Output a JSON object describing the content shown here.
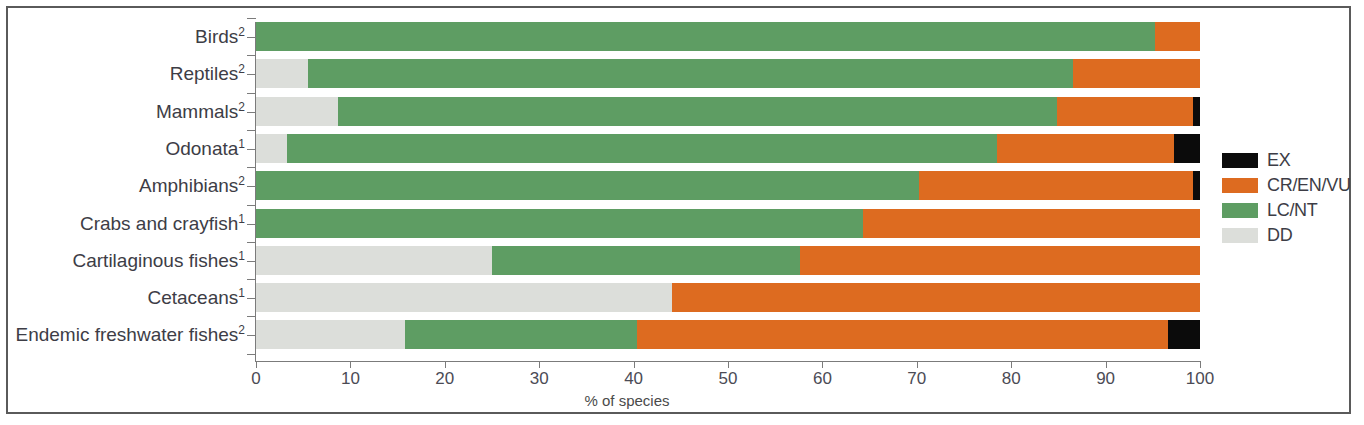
{
  "figure": {
    "axis_title": "% of species",
    "frame_color": "#5a5a5a",
    "background": "#ffffff"
  },
  "legend": {
    "position": "right",
    "items": [
      {
        "label": "EX",
        "color": "#0b0b0b",
        "key": "ex"
      },
      {
        "label": "CR/EN/VU",
        "color": "#dd6b20",
        "key": "crenvu"
      },
      {
        "label": "LC/NT",
        "color": "#5e9d63",
        "key": "lcnt"
      },
      {
        "label": "DD",
        "color": "#dcdeda",
        "key": "dd"
      }
    ]
  },
  "chart_data": {
    "type": "bar",
    "orientation": "horizontal",
    "stacked": true,
    "stack_mode": "percent",
    "title": "",
    "subtitle": "",
    "xlabel": "% of species",
    "ylabel": "",
    "xlim": [
      0,
      100
    ],
    "xticks": [
      0,
      10,
      20,
      30,
      40,
      50,
      60,
      70,
      80,
      90,
      100
    ],
    "xticklabels": [
      "0",
      "10",
      "20",
      "30",
      "40",
      "50",
      "60",
      "70",
      "80",
      "90",
      "100"
    ],
    "grid": false,
    "legend_entries": [
      "EX",
      "CR/EN/VU",
      "LC/NT",
      "DD"
    ],
    "categories": [
      "Birds",
      "Reptiles",
      "Mammals",
      "Odonata",
      "Amphibians",
      "Crabs and crayfish",
      "Cartilaginous fishes",
      "Cetaceans",
      "Endemic freshwater fishes"
    ],
    "category_footnotes": [
      "2",
      "2",
      "2",
      "1",
      "2",
      "1",
      "1",
      "1",
      "2"
    ],
    "series": [
      {
        "name": "DD",
        "color": "#dcdeda",
        "values": [
          0.0,
          5.5,
          8.7,
          3.3,
          0.0,
          0.0,
          25.0,
          44.1,
          15.8
        ]
      },
      {
        "name": "LC/NT",
        "color": "#5e9d63",
        "values": [
          95.2,
          81.1,
          76.1,
          75.2,
          70.2,
          64.3,
          32.6,
          0.0,
          24.6
        ]
      },
      {
        "name": "CR/EN/VU",
        "color": "#dd6b20",
        "values": [
          4.8,
          13.4,
          14.5,
          18.8,
          29.1,
          35.7,
          42.4,
          55.9,
          56.2
        ]
      },
      {
        "name": "EX",
        "color": "#0b0b0b",
        "values": [
          0.0,
          0.0,
          0.7,
          2.7,
          0.7,
          0.0,
          0.0,
          0.0,
          3.4
        ]
      }
    ],
    "bars": [
      {
        "category": "Birds",
        "footnote": "2",
        "dd": 0.0,
        "lcnt": 95.2,
        "crenvu": 4.8,
        "ex": 0.0
      },
      {
        "category": "Reptiles",
        "footnote": "2",
        "dd": 5.5,
        "lcnt": 81.1,
        "crenvu": 13.4,
        "ex": 0.0
      },
      {
        "category": "Mammals",
        "footnote": "2",
        "dd": 8.7,
        "lcnt": 76.1,
        "crenvu": 14.5,
        "ex": 0.7
      },
      {
        "category": "Odonata",
        "footnote": "1",
        "dd": 3.3,
        "lcnt": 75.2,
        "crenvu": 18.8,
        "ex": 2.7
      },
      {
        "category": "Amphibians",
        "footnote": "2",
        "dd": 0.0,
        "lcnt": 70.2,
        "crenvu": 29.1,
        "ex": 0.7
      },
      {
        "category": "Crabs and crayfish",
        "footnote": "1",
        "dd": 0.0,
        "lcnt": 64.3,
        "crenvu": 35.7,
        "ex": 0.0
      },
      {
        "category": "Cartilaginous fishes",
        "footnote": "1",
        "dd": 25.0,
        "lcnt": 32.6,
        "crenvu": 42.4,
        "ex": 0.0
      },
      {
        "category": "Cetaceans",
        "footnote": "1",
        "dd": 44.1,
        "lcnt": 0.0,
        "crenvu": 55.9,
        "ex": 0.0
      },
      {
        "category": "Endemic freshwater fishes",
        "footnote": "2",
        "dd": 15.8,
        "lcnt": 24.6,
        "crenvu": 56.2,
        "ex": 3.4
      }
    ]
  }
}
